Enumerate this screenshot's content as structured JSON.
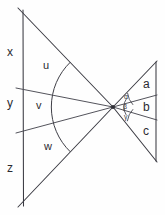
{
  "figure": {
    "background_color": "#fefefe",
    "line_color": "#3a3a42",
    "text_color": "#2b2b31",
    "vertex": {
      "x": 113,
      "y": 107,
      "name": "apex-point"
    },
    "left_segment_labels": [
      {
        "id": "x",
        "text": "x",
        "x": 7,
        "y": 52
      },
      {
        "id": "y",
        "text": "y",
        "x": 7,
        "y": 103
      },
      {
        "id": "z",
        "text": "z",
        "x": 7,
        "y": 168
      }
    ],
    "left_angle_labels": [
      {
        "id": "u",
        "text": "u",
        "x": 44,
        "y": 66
      },
      {
        "id": "v",
        "text": "v",
        "x": 37,
        "y": 106
      },
      {
        "id": "w",
        "text": "w",
        "x": 45,
        "y": 147
      }
    ],
    "right_segment_labels": [
      {
        "id": "a",
        "text": "a",
        "x": 144,
        "y": 84
      },
      {
        "id": "b",
        "text": "b",
        "x": 144,
        "y": 107
      },
      {
        "id": "c",
        "text": "c",
        "x": 144,
        "y": 131
      }
    ],
    "right_angle_labels": [
      {
        "id": "alpha",
        "text": "α",
        "x": 126,
        "y": 96
      },
      {
        "id": "beta",
        "text": "β",
        "x": 125,
        "y": 105
      },
      {
        "id": "gamma",
        "text": "γ",
        "x": 126,
        "y": 115
      }
    ],
    "left_vertical_axis": {
      "x": 23,
      "y1": 10,
      "y2": 206
    },
    "right_vertical_axis": {
      "x": 156,
      "y1": 62,
      "y2": 161
    },
    "left_rays": [
      {
        "id": "ray-upper-outer",
        "x1": 113,
        "y1": 107,
        "x2": 18,
        "y2": 8
      },
      {
        "id": "ray-upper-inner",
        "x1": 113,
        "y1": 107,
        "x2": 16,
        "y2": 88
      },
      {
        "id": "ray-lower-inner",
        "x1": 113,
        "y1": 107,
        "x2": 16,
        "y2": 133
      },
      {
        "id": "ray-lower-outer",
        "x1": 113,
        "y1": 107,
        "x2": 18,
        "y2": 207
      }
    ],
    "right_rays": [
      {
        "id": "ray-right-upper",
        "x1": 113,
        "y1": 107,
        "x2": 157,
        "y2": 61
      },
      {
        "id": "ray-right-mid-upper",
        "x1": 113,
        "y1": 107,
        "x2": 157,
        "y2": 95
      },
      {
        "id": "ray-right-mid-lower",
        "x1": 113,
        "y1": 107,
        "x2": 157,
        "y2": 120
      },
      {
        "id": "ray-right-lower",
        "x1": 113,
        "y1": 107,
        "x2": 157,
        "y2": 162
      }
    ],
    "left_arc": {
      "id": "big-angle-arc",
      "radius": 62,
      "start_deg": -46,
      "end_deg": 46
    },
    "small_arcs": [
      {
        "id": "arc-alpha",
        "radius": 20
      },
      {
        "id": "arc-beta",
        "radius": 14
      },
      {
        "id": "arc-gamma",
        "radius": 20
      }
    ]
  }
}
